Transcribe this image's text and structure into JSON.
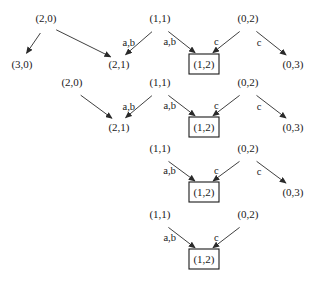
{
  "diagram": {
    "type": "state-transition-sequence",
    "rows": [
      {
        "nodes": [
          {
            "id": "r1-20",
            "label": "(2,0)",
            "x": 46,
            "y": 22
          },
          {
            "id": "r1-11",
            "label": "(1,1)",
            "x": 160,
            "y": 22
          },
          {
            "id": "r1-02",
            "label": "(0,2)",
            "x": 248,
            "y": 22
          },
          {
            "id": "r1-30",
            "label": "(3,0)",
            "x": 22,
            "y": 68
          },
          {
            "id": "r1-21",
            "label": "(2,1)",
            "x": 119,
            "y": 68
          },
          {
            "id": "r1-12",
            "label": "(1,2)",
            "x": 204,
            "y": 68,
            "boxed": true
          },
          {
            "id": "r1-03",
            "label": "(0,3)",
            "x": 293,
            "y": 68
          }
        ],
        "edges": [
          {
            "from": "r1-20",
            "to": "r1-30",
            "label": ""
          },
          {
            "from": "r1-20",
            "to": "r1-21",
            "label": ""
          },
          {
            "from": "r1-11",
            "to": "r1-21",
            "label": "a,b"
          },
          {
            "from": "r1-11",
            "to": "r1-12",
            "label": "a,b"
          },
          {
            "from": "r1-02",
            "to": "r1-12",
            "label": "c"
          },
          {
            "from": "r1-02",
            "to": "r1-03",
            "label": "c"
          }
        ]
      },
      {
        "nodes": [
          {
            "id": "r2-20",
            "label": "(2,0)",
            "x": 72,
            "y": 86
          },
          {
            "id": "r2-11",
            "label": "(1,1)",
            "x": 160,
            "y": 86
          },
          {
            "id": "r2-02",
            "label": "(0,2)",
            "x": 248,
            "y": 86
          },
          {
            "id": "r2-21",
            "label": "(2,1)",
            "x": 119,
            "y": 131
          },
          {
            "id": "r2-12",
            "label": "(1,2)",
            "x": 204,
            "y": 131,
            "boxed": true
          },
          {
            "id": "r2-03",
            "label": "(0,3)",
            "x": 293,
            "y": 131
          }
        ],
        "edges": [
          {
            "from": "r2-20",
            "to": "r2-21",
            "label": ""
          },
          {
            "from": "r2-11",
            "to": "r2-21",
            "label": "a,b"
          },
          {
            "from": "r2-11",
            "to": "r2-12",
            "label": "a,b"
          },
          {
            "from": "r2-02",
            "to": "r2-12",
            "label": "c"
          },
          {
            "from": "r2-02",
            "to": "r2-03",
            "label": "c"
          }
        ]
      },
      {
        "nodes": [
          {
            "id": "r3-11",
            "label": "(1,1)",
            "x": 160,
            "y": 152
          },
          {
            "id": "r3-02",
            "label": "(0,2)",
            "x": 248,
            "y": 152
          },
          {
            "id": "r3-12",
            "label": "(1,2)",
            "x": 204,
            "y": 196,
            "boxed": true
          },
          {
            "id": "r3-03",
            "label": "(0,3)",
            "x": 293,
            "y": 196
          }
        ],
        "edges": [
          {
            "from": "r3-11",
            "to": "r3-12",
            "label": "a,b"
          },
          {
            "from": "r3-02",
            "to": "r3-12",
            "label": "c"
          },
          {
            "from": "r3-02",
            "to": "r3-03",
            "label": "c"
          }
        ]
      },
      {
        "nodes": [
          {
            "id": "r4-11",
            "label": "(1,1)",
            "x": 160,
            "y": 218
          },
          {
            "id": "r4-02",
            "label": "(0,2)",
            "x": 248,
            "y": 218
          },
          {
            "id": "r4-12",
            "label": "(1,2)",
            "x": 204,
            "y": 263,
            "boxed": true
          }
        ],
        "edges": [
          {
            "from": "r4-11",
            "to": "r4-12",
            "label": "a,b"
          },
          {
            "from": "r4-02",
            "to": "r4-12",
            "label": "c"
          }
        ]
      }
    ]
  }
}
